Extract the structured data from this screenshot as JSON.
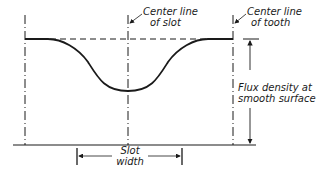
{
  "diagram": {
    "labels": {
      "slot_center": {
        "line1": "Center line",
        "line2": "of slot"
      },
      "tooth_center": {
        "line1": "Center line",
        "line2": "of tooth"
      },
      "flux": {
        "line1": "Flux density at",
        "line2": "smooth surface"
      },
      "slot_width": {
        "line1": "Slot",
        "line2": "width"
      }
    },
    "colors": {
      "ink": "#1a1a1a",
      "background": "#ffffff"
    }
  }
}
